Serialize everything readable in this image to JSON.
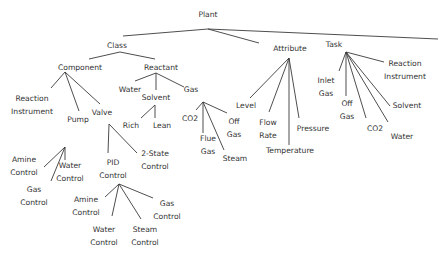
{
  "diagram": {
    "type": "tree",
    "line_color": "#3a3a3a",
    "text_color": "#333333",
    "nodes": {
      "plant": {
        "label": [
          "Plant"
        ],
        "x": 208,
        "y": 17
      },
      "class": {
        "label": [
          "Class"
        ],
        "x": 117,
        "y": 48
      },
      "attribute": {
        "label": [
          "Attribute"
        ],
        "x": 290,
        "y": 51
      },
      "task": {
        "label": [
          "Task"
        ],
        "x": 334,
        "y": 47
      },
      "component": {
        "label": [
          "Component"
        ],
        "x": 80,
        "y": 70
      },
      "reactant": {
        "label": [
          "Reactant"
        ],
        "x": 161,
        "y": 70
      },
      "reaction_instrument_c": {
        "label": [
          "Reaction",
          "Instrument"
        ],
        "x": 32,
        "y": 101
      },
      "pump": {
        "label": [
          "Pump"
        ],
        "x": 78,
        "y": 122
      },
      "valve": {
        "label": [
          "Valve"
        ],
        "x": 102,
        "y": 115
      },
      "water_r": {
        "label": [
          "Water"
        ],
        "x": 130,
        "y": 92
      },
      "solvent_r": {
        "label": [
          "Solvent"
        ],
        "x": 156,
        "y": 100
      },
      "gas_r": {
        "label": [
          "Gas"
        ],
        "x": 191,
        "y": 92
      },
      "rich": {
        "label": [
          "Rich"
        ],
        "x": 131,
        "y": 128
      },
      "lean": {
        "label": [
          "Lean"
        ],
        "x": 162,
        "y": 128
      },
      "co2_g": {
        "label": [
          "CO2"
        ],
        "x": 190,
        "y": 121
      },
      "flue_gas": {
        "label": [
          "Flue",
          "Gas"
        ],
        "x": 208,
        "y": 141
      },
      "off_gas_g": {
        "label": [
          "Off",
          "Gas"
        ],
        "x": 234,
        "y": 124
      },
      "steam_g": {
        "label": [
          "Steam"
        ],
        "x": 235,
        "y": 161
      },
      "level": {
        "label": [
          "Level"
        ],
        "x": 246,
        "y": 108
      },
      "flow_rate": {
        "label": [
          "Flow",
          "Rate"
        ],
        "x": 268,
        "y": 125
      },
      "temperature": {
        "label": [
          "Temperature"
        ],
        "x": 290,
        "y": 153
      },
      "pressure": {
        "label": [
          "Pressure"
        ],
        "x": 313,
        "y": 131
      },
      "inlet_gas": {
        "label": [
          "Inlet",
          "Gas"
        ],
        "x": 326,
        "y": 83
      },
      "off_gas_t": {
        "label": [
          "Off",
          "Gas"
        ],
        "x": 347,
        "y": 106
      },
      "co2_t": {
        "label": [
          "CO2"
        ],
        "x": 375,
        "y": 131
      },
      "water_t": {
        "label": [
          "Water"
        ],
        "x": 402,
        "y": 139
      },
      "solvent_t": {
        "label": [
          "Solvent"
        ],
        "x": 407,
        "y": 108
      },
      "reaction_instrument_t": {
        "label": [
          "Reaction",
          "Instrument"
        ],
        "x": 405,
        "y": 66
      },
      "amine_control_p": {
        "label": [
          "Amine",
          "Control"
        ],
        "x": 24,
        "y": 162
      },
      "gas_control_p": {
        "label": [
          "Gas",
          "Control"
        ],
        "x": 34,
        "y": 192
      },
      "water_control_p": {
        "label": [
          "Water",
          "Control"
        ],
        "x": 70,
        "y": 168
      },
      "pid_control": {
        "label": [
          "PID",
          "Control"
        ],
        "x": 113,
        "y": 165
      },
      "two_state_control": {
        "label": [
          "2-State",
          "Control"
        ],
        "x": 155,
        "y": 156
      },
      "amine_control_v": {
        "label": [
          "Amine",
          "Control"
        ],
        "x": 86,
        "y": 202
      },
      "water_control_v": {
        "label": [
          "Water",
          "Control"
        ],
        "x": 104,
        "y": 232
      },
      "steam_control": {
        "label": [
          "Steam",
          "Control"
        ],
        "x": 145,
        "y": 232
      },
      "gas_control_v": {
        "label": [
          "Gas",
          "Control"
        ],
        "x": 167,
        "y": 206
      }
    },
    "edges": [
      [
        208,
        29,
        123,
        36
      ],
      [
        208,
        29,
        259,
        43
      ],
      [
        208,
        29,
        438,
        39
      ],
      [
        120,
        52,
        89,
        59
      ],
      [
        120,
        52,
        155,
        59
      ],
      [
        65,
        72,
        51,
        88
      ],
      [
        65,
        72,
        79,
        111
      ],
      [
        65,
        72,
        100,
        104
      ],
      [
        156,
        73,
        135,
        81
      ],
      [
        156,
        73,
        156,
        90
      ],
      [
        156,
        73,
        184,
        87
      ],
      [
        155,
        105,
        141,
        118
      ],
      [
        155,
        105,
        155,
        118
      ],
      [
        65,
        147,
        44,
        167
      ],
      [
        65,
        147,
        51,
        181
      ],
      [
        65,
        147,
        65,
        160
      ],
      [
        109,
        124,
        108,
        153
      ],
      [
        109,
        124,
        137,
        153
      ],
      [
        119,
        184,
        105,
        197
      ],
      [
        119,
        184,
        112,
        216
      ],
      [
        119,
        184,
        141,
        219
      ],
      [
        119,
        184,
        153,
        198
      ],
      [
        203,
        102,
        196,
        110
      ],
      [
        203,
        102,
        203,
        133
      ],
      [
        203,
        102,
        227,
        113
      ],
      [
        203,
        102,
        224,
        150
      ],
      [
        289,
        58,
        250,
        98
      ],
      [
        289,
        58,
        269,
        112
      ],
      [
        289,
        58,
        289,
        145
      ],
      [
        289,
        58,
        299,
        118
      ],
      [
        346,
        52,
        339,
        71
      ],
      [
        346,
        52,
        346,
        96
      ],
      [
        346,
        52,
        366,
        118
      ],
      [
        346,
        52,
        388,
        122
      ],
      [
        346,
        52,
        390,
        106
      ],
      [
        346,
        52,
        384,
        62
      ]
    ]
  }
}
